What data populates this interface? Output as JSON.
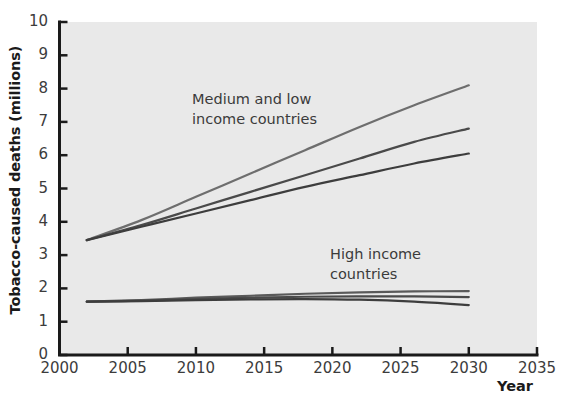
{
  "figure": {
    "background_color": "#ffffff",
    "plot_background_color": "#e9e9e9",
    "axis_color": "#1a1a1a"
  },
  "axes": {
    "y_title": "Tobacco-caused deaths (millions)",
    "x_title": "Year",
    "y_ticks": [
      "0",
      "1",
      "2",
      "3",
      "4",
      "5",
      "6",
      "7",
      "8",
      "9",
      "10"
    ],
    "x_ticks": [
      "2000",
      "2005",
      "2010",
      "2015",
      "2020",
      "2025",
      "2030",
      "2035"
    ]
  },
  "annotations": {
    "medium_low": "Medium and low\nincome countries",
    "high": "High income\ncountries"
  },
  "chart_data": {
    "type": "line",
    "title": "",
    "xlabel": "Year",
    "ylabel": "Tobacco-caused deaths (millions)",
    "xlim": [
      2000,
      2035
    ],
    "ylim": [
      0,
      10
    ],
    "xticks": [
      2000,
      2005,
      2010,
      2015,
      2020,
      2025,
      2030,
      2035
    ],
    "yticks": [
      0,
      1,
      2,
      3,
      4,
      5,
      6,
      7,
      8,
      9,
      10
    ],
    "grid": false,
    "legend": "none (inline text annotations)",
    "x": [
      2002,
      2006,
      2010,
      2014,
      2018,
      2022,
      2026,
      2030
    ],
    "series": [
      {
        "name": "Medium and low income countries - upper projection",
        "group": "Medium and low income countries",
        "color": "#6e6e6e",
        "values": [
          3.45,
          4.05,
          4.75,
          5.45,
          6.15,
          6.85,
          7.5,
          8.1
        ]
      },
      {
        "name": "Medium and low income countries - middle projection",
        "group": "Medium and low income countries",
        "color": "#4a4a4a",
        "values": [
          3.45,
          3.9,
          4.4,
          4.9,
          5.4,
          5.9,
          6.4,
          6.8
        ]
      },
      {
        "name": "Medium and low income countries - lower projection",
        "group": "Medium and low income countries",
        "color": "#3d3d3d",
        "values": [
          3.45,
          3.85,
          4.25,
          4.65,
          5.05,
          5.4,
          5.75,
          6.05
        ]
      },
      {
        "name": "High income countries - upper projection",
        "group": "High income countries",
        "color": "#5a5a5a",
        "values": [
          1.6,
          1.65,
          1.72,
          1.78,
          1.84,
          1.88,
          1.91,
          1.92
        ]
      },
      {
        "name": "High income countries - middle projection",
        "group": "High income countries",
        "color": "#4a4a4a",
        "values": [
          1.6,
          1.63,
          1.68,
          1.72,
          1.75,
          1.76,
          1.76,
          1.74
        ]
      },
      {
        "name": "High income countries - lower projection",
        "group": "High income countries",
        "color": "#3d3d3d",
        "values": [
          1.6,
          1.62,
          1.65,
          1.67,
          1.68,
          1.66,
          1.6,
          1.5
        ]
      }
    ]
  }
}
